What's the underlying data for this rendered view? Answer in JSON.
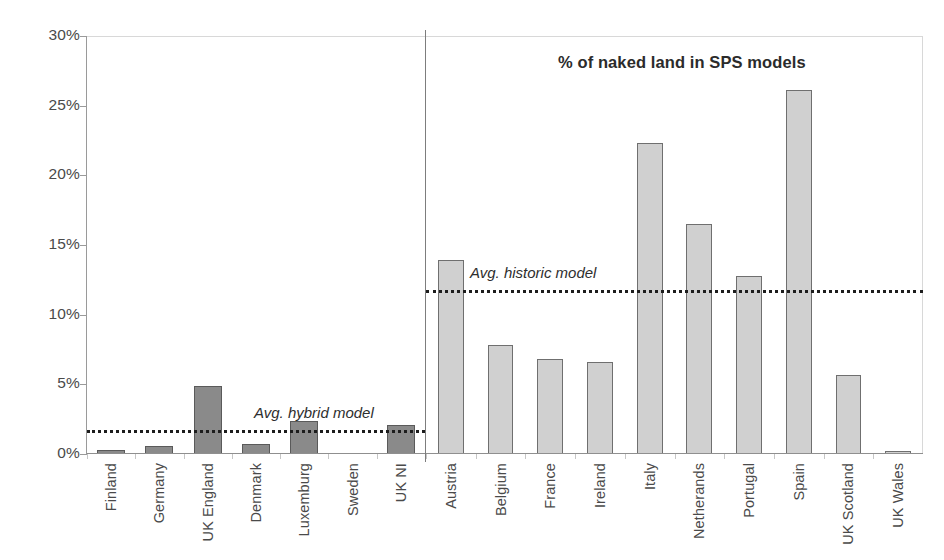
{
  "chart_data": {
    "type": "bar",
    "title": "% of naked land in SPS models",
    "xlabel": "",
    "ylabel": "",
    "ylim": [
      0,
      30
    ],
    "grid": false,
    "legend_position": "none",
    "y_ticks": [
      {
        "value": 30,
        "label": "30%"
      },
      {
        "value": 25,
        "label": "25%"
      },
      {
        "value": 20,
        "label": "20%"
      },
      {
        "value": 15,
        "label": "15%"
      },
      {
        "value": 10,
        "label": "10%"
      },
      {
        "value": 5,
        "label": "5%"
      },
      {
        "value": 0,
        "label": "0%"
      }
    ],
    "panels": [
      {
        "name": "hybrid-models-panel",
        "categories": [
          "Finland",
          "Germany",
          "UK England",
          "Denmark",
          "Luxemburg",
          "Sweden",
          "UK NI"
        ],
        "values": [
          0.3,
          0.6,
          4.9,
          0.7,
          2.4,
          0.0,
          2.1
        ],
        "bar_style": "dark",
        "bar_color": "#8a8a8a",
        "bar_border_color": "#5a5a5a",
        "reference_line": {
          "label": "Avg. hybrid model",
          "value": 1.7,
          "color": "#1d1d1d",
          "style": "dotted"
        }
      },
      {
        "name": "historic-models-panel",
        "categories": [
          "Austria",
          "Belgium",
          "France",
          "Ireland",
          "Italy",
          "Netherands",
          "Portugal",
          "Spain",
          "UK Scotland",
          "UK Wales"
        ],
        "values": [
          13.9,
          7.8,
          6.8,
          6.6,
          22.3,
          16.5,
          12.8,
          26.1,
          5.7,
          0.2
        ],
        "bar_style": "light",
        "bar_color": "#d0d0d0",
        "bar_border_color": "#6f6f6f",
        "reference_line": {
          "label": "Avg. historic model",
          "value": 11.8,
          "color": "#1d1d1d",
          "style": "dotted"
        }
      }
    ]
  },
  "axis": {
    "max": 30,
    "min": 0
  }
}
